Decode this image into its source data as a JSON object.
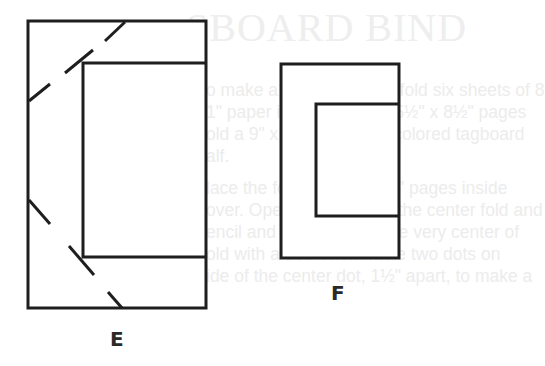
{
  "background_ghost_text": {
    "heading": "SBOARD BIND",
    "lines": [
      "o make a 24-page book, fold six sheets of 8",
      "1\" paper in half, making 5½\" x 8½\" pages",
      "old a 9\" x 11½\" piece of colored tagboard",
      "alf.",
      "lace the folded 5½\" x 8½\" pages inside",
      "over. Open the pages at the center fold and",
      "encil and ruler to mark the very center of",
      "old with a dot. Then make two dots on",
      "ide of the center dot, 1½\" apart, to make a"
    ]
  },
  "figures": [
    {
      "id": "E",
      "label": "E",
      "description": "cover with inserted pages and diagonal dashed fold lines at corners"
    },
    {
      "id": "F",
      "label": "F",
      "description": "cover with inserted pages, no fold lines"
    }
  ],
  "colors": {
    "line": "#1e1e1e",
    "ghost": "#ececec"
  }
}
